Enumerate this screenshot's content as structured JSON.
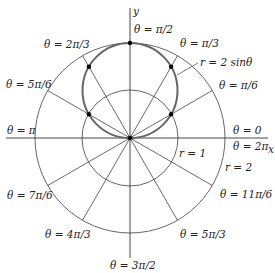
{
  "diagram": {
    "colors": {
      "grid": "#555555",
      "curve": "#666666",
      "axis": "#333333",
      "point": "#000000",
      "text": "#222222"
    },
    "axes": {
      "x_label": "x",
      "y_label": "y"
    },
    "circles": [
      {
        "r": 1,
        "label": "r = 1"
      },
      {
        "r": 2,
        "label": "r = 2"
      }
    ],
    "curve": {
      "equation": "r = 2 sinθ",
      "label": "r = 2 sinθ"
    },
    "rays": [
      {
        "angle": "0",
        "label": "θ = 0"
      },
      {
        "angle": "π/6",
        "label": "θ = π/6"
      },
      {
        "angle": "π/3",
        "label": "θ = π/3"
      },
      {
        "angle": "π/2",
        "label": "θ = π/2"
      },
      {
        "angle": "2π/3",
        "label": "θ = 2π/3"
      },
      {
        "angle": "5π/6",
        "label": "θ = 5π/6"
      },
      {
        "angle": "π",
        "label": "θ = π"
      },
      {
        "angle": "7π/6",
        "label": "θ = 7π/6"
      },
      {
        "angle": "4π/3",
        "label": "θ = 4π/3"
      },
      {
        "angle": "3π/2",
        "label": "θ = 3π/2"
      },
      {
        "angle": "5π/3",
        "label": "θ = 5π/3"
      },
      {
        "angle": "11π/6",
        "label": "θ = 11π/6"
      },
      {
        "angle": "2π",
        "label": "θ = 2π"
      }
    ]
  }
}
